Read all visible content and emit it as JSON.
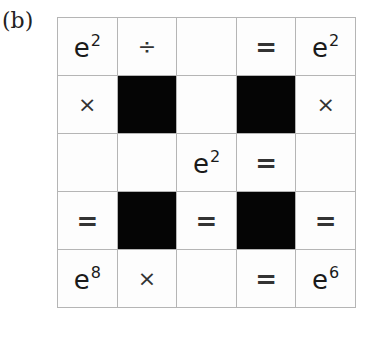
{
  "panel_label": "(b)",
  "grid": {
    "rows": 5,
    "cols": 5,
    "cells": [
      [
        {
          "type": "value",
          "base": "e",
          "exp": "2"
        },
        {
          "type": "op",
          "text": "÷"
        },
        {
          "type": "empty"
        },
        {
          "type": "op",
          "text": "="
        },
        {
          "type": "value",
          "base": "e",
          "exp": "2"
        }
      ],
      [
        {
          "type": "op",
          "text": "×"
        },
        {
          "type": "black"
        },
        {
          "type": "empty"
        },
        {
          "type": "black"
        },
        {
          "type": "op",
          "text": "×"
        }
      ],
      [
        {
          "type": "empty"
        },
        {
          "type": "empty"
        },
        {
          "type": "value",
          "base": "e",
          "exp": "2"
        },
        {
          "type": "op",
          "text": "="
        },
        {
          "type": "empty"
        }
      ],
      [
        {
          "type": "op",
          "text": "="
        },
        {
          "type": "black"
        },
        {
          "type": "op",
          "text": "="
        },
        {
          "type": "black"
        },
        {
          "type": "op",
          "text": "="
        }
      ],
      [
        {
          "type": "value",
          "base": "e",
          "exp": "8"
        },
        {
          "type": "op",
          "text": "×"
        },
        {
          "type": "empty"
        },
        {
          "type": "op",
          "text": "="
        },
        {
          "type": "value",
          "base": "e",
          "exp": "6"
        }
      ]
    ]
  },
  "colors": {
    "grid_line": "#b5b5b5",
    "black_cell": "#050505",
    "background": "#ffffff"
  }
}
